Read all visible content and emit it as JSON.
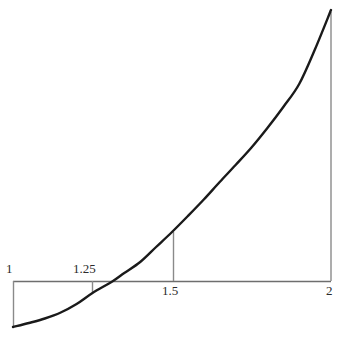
{
  "figure": {
    "width": 344,
    "height": 348,
    "background": "#ffffff",
    "axis_color": "#6e6e6e",
    "curve_color": "#1a1a1a",
    "guide_color": "#8a8a8a"
  },
  "axis": {
    "name": "horizontal-axis",
    "y_pixel": 281,
    "x_start_pixel": 13,
    "x_end_pixel": 331,
    "x_min": 1,
    "x_max": 2
  },
  "tick_labels": {
    "x1": "1",
    "x125": "1.25",
    "x15": "1.5",
    "x2": "2"
  },
  "guides": [
    {
      "name": "guide-line-x-1",
      "x_value": 1,
      "x_pixel": 13,
      "y_top_pixel": 281,
      "y_bottom_pixel": 327
    },
    {
      "name": "guide-line-x-1.25",
      "x_value": 1.25,
      "x_pixel": 92,
      "y_top_pixel": 281,
      "y_bottom_pixel": 293
    },
    {
      "name": "guide-line-x-1.5",
      "x_value": 1.5,
      "x_pixel": 173,
      "y_top_pixel": 232,
      "y_bottom_pixel": 281
    },
    {
      "name": "guide-line-x-2",
      "x_value": 2,
      "x_pixel": 331,
      "y_top_pixel": 12,
      "y_bottom_pixel": 281
    }
  ],
  "chart_data": {
    "type": "line",
    "title": "",
    "subtitle": "",
    "xlabel": "",
    "ylabel": "",
    "xlim": [
      1,
      2
    ],
    "xticks": [
      1,
      1.25,
      1.5,
      2
    ],
    "xticklabels": [
      "1",
      "1.25",
      "1.5",
      "2"
    ],
    "yticks": [],
    "yticklabels": [],
    "grid": false,
    "legend": null,
    "annotations": [],
    "series": [
      {
        "name": "curve",
        "color": "#1a1a1a",
        "linewidth": 2.4,
        "x": [
          1.0,
          1.05,
          1.1,
          1.15,
          1.2,
          1.25,
          1.3145,
          1.35,
          1.4,
          1.45,
          1.5,
          1.55,
          1.6,
          1.65,
          1.7,
          1.75,
          1.8,
          1.85,
          1.9,
          1.95,
          2.0
        ],
        "y_pixel": [
          327,
          323,
          318.5,
          312.5,
          304,
          293,
          281,
          273,
          262,
          247,
          232,
          216,
          199.5,
          182,
          165,
          147.5,
          128,
          107,
          84,
          49,
          10
        ],
        "x_axis_crossing": 1.3145,
        "description": "Smooth increasing convex curve rising from lower-left to upper-right, crossing the horizontal axis near x = 1.31"
      }
    ]
  }
}
